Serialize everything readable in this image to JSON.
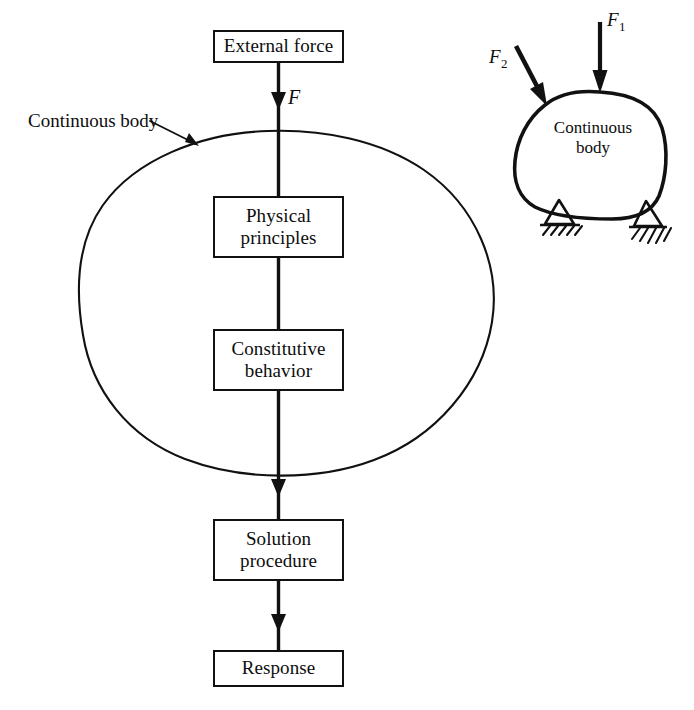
{
  "figure": {
    "type": "flow-diagram",
    "background_color": "#ffffff",
    "ink_color": "#111111"
  },
  "flow": {
    "nodes": [
      {
        "id": "external-force",
        "label": "External force"
      },
      {
        "id": "physical-principles",
        "label": "Physical\nprinciples",
        "line1": "Physical",
        "line2": "principles"
      },
      {
        "id": "constitutive-behavior",
        "label": "Constitutive\nbehavior",
        "line1": "Constitutive",
        "line2": "behavior"
      },
      {
        "id": "solution-procedure",
        "label": "Solution\nprocedure",
        "line1": "Solution",
        "line2": "procedure"
      },
      {
        "id": "response",
        "label": "Response"
      }
    ],
    "edge_label": "F",
    "outer_body_label": "Continuous body"
  },
  "inset": {
    "body_label_line1": "Continuous",
    "body_label_line2": "body",
    "forces": [
      {
        "name": "F",
        "subscript": "1",
        "direction": "vertical-down"
      },
      {
        "name": "F",
        "subscript": "2",
        "direction": "diagonal-down-right"
      }
    ],
    "supports": 2
  }
}
